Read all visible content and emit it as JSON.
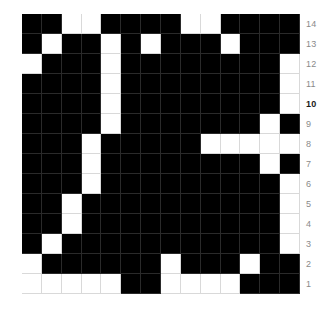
{
  "chart_data": {
    "type": "heatmap",
    "title": "",
    "subtitle": "",
    "xlabel": "",
    "ylabel": "",
    "legend": [],
    "grid": true,
    "legend_position": "none",
    "colors": {
      "on": "#000000",
      "off": "#ffffff",
      "gridline": "#d9d9d9",
      "tick_text": "#8a8a8a",
      "tick_text_emphasis": "#1a1a1a"
    },
    "x": [
      1,
      2,
      3,
      4,
      5,
      6,
      7,
      8,
      9,
      10,
      11,
      12,
      13,
      14
    ],
    "xtick_labels": [],
    "y": [
      14,
      13,
      12,
      11,
      10,
      9,
      8,
      7,
      6,
      5,
      4,
      3,
      2,
      1
    ],
    "ytick_labels": [
      "14",
      "13",
      "12",
      "11",
      "10",
      "9",
      "8",
      "7",
      "6",
      "5",
      "4",
      "3",
      "2",
      "1"
    ],
    "ytick_emphasis": "10",
    "value_meaning": {
      "1": "filled (black)",
      "0": "empty (white)"
    },
    "rows": [
      {
        "label": "14",
        "values": [
          1,
          1,
          0,
          0,
          1,
          1,
          1,
          1,
          0,
          0,
          1,
          1,
          1,
          1
        ]
      },
      {
        "label": "13",
        "values": [
          1,
          0,
          1,
          1,
          0,
          1,
          0,
          1,
          1,
          1,
          0,
          1,
          1,
          1
        ]
      },
      {
        "label": "12",
        "values": [
          0,
          1,
          1,
          1,
          0,
          1,
          1,
          1,
          1,
          1,
          1,
          1,
          1,
          0
        ]
      },
      {
        "label": "11",
        "values": [
          1,
          1,
          1,
          1,
          0,
          1,
          1,
          1,
          1,
          1,
          1,
          1,
          1,
          0
        ]
      },
      {
        "label": "10",
        "values": [
          1,
          1,
          1,
          1,
          0,
          1,
          1,
          1,
          1,
          1,
          1,
          1,
          1,
          0
        ]
      },
      {
        "label": "9",
        "values": [
          1,
          1,
          1,
          1,
          0,
          1,
          1,
          1,
          1,
          1,
          1,
          1,
          0,
          1
        ]
      },
      {
        "label": "8",
        "values": [
          1,
          1,
          1,
          0,
          1,
          1,
          1,
          1,
          1,
          0,
          0,
          0,
          0,
          0
        ]
      },
      {
        "label": "7",
        "values": [
          1,
          1,
          1,
          0,
          1,
          1,
          1,
          1,
          1,
          1,
          1,
          1,
          0,
          1
        ]
      },
      {
        "label": "6",
        "values": [
          1,
          1,
          1,
          0,
          1,
          1,
          1,
          1,
          1,
          1,
          1,
          1,
          1,
          0
        ]
      },
      {
        "label": "5",
        "values": [
          1,
          1,
          0,
          1,
          1,
          1,
          1,
          1,
          1,
          1,
          1,
          1,
          1,
          0
        ]
      },
      {
        "label": "4",
        "values": [
          1,
          1,
          0,
          1,
          1,
          1,
          1,
          1,
          1,
          1,
          1,
          1,
          1,
          0
        ]
      },
      {
        "label": "3",
        "values": [
          1,
          0,
          1,
          1,
          1,
          1,
          1,
          1,
          1,
          1,
          1,
          1,
          1,
          0
        ]
      },
      {
        "label": "2",
        "values": [
          0,
          1,
          1,
          1,
          1,
          1,
          1,
          0,
          1,
          1,
          1,
          0,
          1,
          1
        ]
      },
      {
        "label": "1",
        "values": [
          0,
          0,
          0,
          0,
          0,
          1,
          1,
          0,
          0,
          0,
          0,
          1,
          1,
          1
        ]
      }
    ]
  }
}
